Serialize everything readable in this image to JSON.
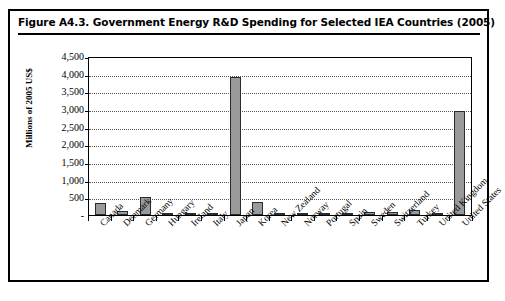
{
  "figure": {
    "title": "Figure A4.3.   Government Energy R&D Spending for Selected IEA Countries (2005)"
  },
  "colors": {
    "bar_fill": "#9a9a9a",
    "bar_border": "#2b2b2b",
    "frame": "#000000",
    "gridline": "#555555",
    "background": "#ffffff"
  },
  "chart_data": {
    "type": "bar",
    "title": "Government Energy R&D Spending for Selected IEA Countries (2005)",
    "xlabel": "",
    "ylabel": "Millions of 2005 US$",
    "ylim": [
      0,
      4500
    ],
    "ytick_values": [
      4500,
      4000,
      3500,
      3000,
      2500,
      2000,
      1500,
      1000,
      500,
      0
    ],
    "ytick_labels": [
      "4,500",
      "4,000",
      "3,500",
      "3,000",
      "2,500",
      "2,000",
      "1,500",
      "1,000",
      "500",
      "-"
    ],
    "grid": true,
    "grid_style": "dotted-horizontal",
    "legend": "none",
    "categories": [
      "Canada",
      "Denmark",
      "Germany",
      "Hungary",
      "Ireland",
      "Italy",
      "Japan",
      "Korea",
      "New Zealand",
      "Norway",
      "Portugal",
      "Spain",
      "Sweden",
      "Switzerland",
      "Turkey",
      "United Kingdom",
      "United States"
    ],
    "values": [
      330,
      100,
      500,
      15,
      10,
      60,
      3900,
      380,
      10,
      55,
      50,
      10,
      75,
      80,
      145,
      15,
      2950
    ]
  }
}
